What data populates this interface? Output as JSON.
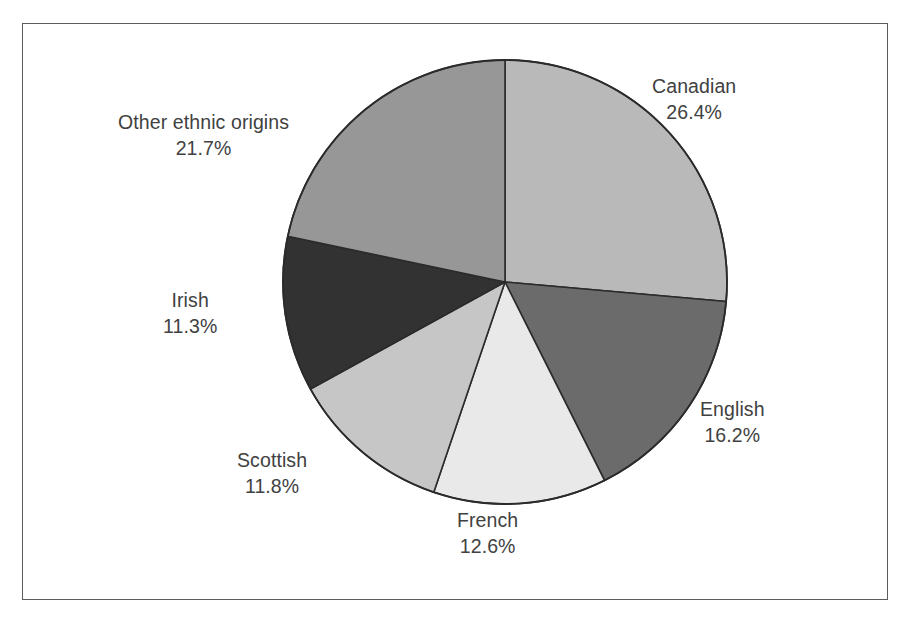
{
  "chart_data": {
    "type": "pie",
    "title": "",
    "subtitle": "",
    "xlabel": "",
    "ylabel": "",
    "legend": "none",
    "grid": false,
    "units": "percent",
    "start_angle_deg": 0,
    "direction": "clockwise",
    "total": 100.0,
    "categories": [
      "Canadian",
      "English",
      "French",
      "Scottish",
      "Irish",
      "Other ethnic origins"
    ],
    "values": [
      26.4,
      16.2,
      12.6,
      11.8,
      11.3,
      21.7
    ],
    "slices": [
      {
        "label": "Canadian",
        "value": 26.4,
        "value_text": "26.4%",
        "color": "#b9b9b9",
        "start_deg": 0.0,
        "end_deg": 95.04
      },
      {
        "label": "English",
        "value": 16.2,
        "value_text": "16.2%",
        "color": "#6b6b6b",
        "start_deg": 95.04,
        "end_deg": 153.36
      },
      {
        "label": "French",
        "value": 12.6,
        "value_text": "12.6%",
        "color": "#e9e9e9",
        "start_deg": 153.36,
        "end_deg": 198.72
      },
      {
        "label": "Scottish",
        "value": 11.8,
        "value_text": "11.8%",
        "color": "#c6c6c6",
        "start_deg": 198.72,
        "end_deg": 241.2
      },
      {
        "label": "Irish",
        "value": 11.3,
        "value_text": "11.3%",
        "color": "#323232",
        "start_deg": 241.2,
        "end_deg": 281.88
      },
      {
        "label": "Other ethnic origins",
        "value": 21.7,
        "value_text": "21.7%",
        "color": "#979797",
        "start_deg": 281.88,
        "end_deg": 360.0
      }
    ]
  },
  "labels": {
    "canadian": {
      "name": "Canadian",
      "value": "26.4%"
    },
    "english": {
      "name": "English",
      "value": "16.2%"
    },
    "french": {
      "name": "French",
      "value": "12.6%"
    },
    "scottish": {
      "name": "Scottish",
      "value": "11.8%"
    },
    "irish": {
      "name": "Irish",
      "value": "11.3%"
    },
    "other": {
      "name": "Other ethnic origins",
      "value": "21.7%"
    }
  },
  "style": {
    "frame_border_color": "#5c5c5c",
    "background_color": "#ffffff",
    "label_text_color": "#414141",
    "slice_outline_color": "#2b2b2b"
  },
  "geometry": {
    "center_x": 505,
    "center_y": 282,
    "radius": 222
  }
}
